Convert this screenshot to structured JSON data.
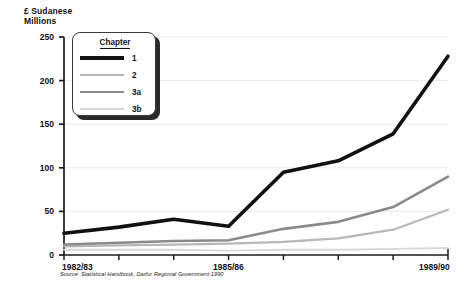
{
  "chart_data": {
    "type": "line",
    "title": "",
    "ylabel": "£ Sudanese\nMillions",
    "xlabel": "",
    "ylim": [
      0,
      250
    ],
    "ytick_values": [
      0,
      50,
      100,
      150,
      200,
      250
    ],
    "ytick_labels": [
      "0",
      "50",
      "100",
      "150",
      "200",
      "250"
    ],
    "grid": true,
    "legend_position": "upper-left",
    "legend_title": "Chapter",
    "categories": [
      "1982/83",
      "1983/84",
      "1984/85",
      "1985/86",
      "1986/87",
      "1987/88",
      "1988/89",
      "1989/90"
    ],
    "xtick_labels_shown": [
      "1982/83",
      "1985/86",
      "1989/90"
    ],
    "xtick_label_indices": [
      0,
      3,
      7
    ],
    "series": [
      {
        "name": "1",
        "color": "#111111",
        "width": 3.6,
        "values": [
          25,
          32,
          41,
          33,
          95,
          108,
          139,
          228
        ]
      },
      {
        "name": "2",
        "color": "#b8b8b8",
        "width": 2.2,
        "values": [
          10,
          11,
          12,
          13,
          15,
          19,
          29,
          52
        ]
      },
      {
        "name": "3a",
        "color": "#8a8a8a",
        "width": 2.6,
        "values": [
          12,
          14,
          16,
          17,
          30,
          38,
          55,
          90
        ]
      },
      {
        "name": "3b",
        "color": "#d8d8d8",
        "width": 1.8,
        "values": [
          6,
          6,
          6,
          5,
          6,
          6,
          7,
          8
        ]
      }
    ],
    "annotations": {
      "source": "Source: Statistical Handbook, Darfur Regional Government 1990"
    }
  },
  "legend": {
    "title": "Chapter",
    "items": [
      {
        "label": "1"
      },
      {
        "label": "2"
      },
      {
        "label": "3a"
      },
      {
        "label": "3b"
      }
    ]
  }
}
